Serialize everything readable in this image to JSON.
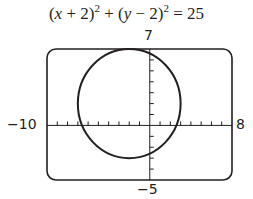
{
  "chart_data": {
    "type": "line",
    "curve": "circle",
    "center": [
      -2,
      2
    ],
    "radius": 5,
    "xlim": [
      -10,
      8
    ],
    "ylim": [
      -5,
      7
    ],
    "xtick_step": 1,
    "ytick_step": 1,
    "grid": false,
    "legend": null,
    "xlabel": "",
    "ylabel": ""
  },
  "labels": {
    "xmin": "−10",
    "xmax": "8",
    "ymin": "−5",
    "ymax": "7"
  },
  "colors": {
    "ink": "#231f20",
    "background": "#ffffff"
  }
}
